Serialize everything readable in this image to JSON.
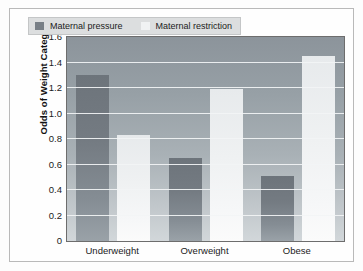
{
  "chart_data": {
    "type": "bar",
    "title": "",
    "subtitle": "",
    "xlabel": "",
    "ylabel": "Odds of Weight Category",
    "categories": [
      "Underweight",
      "Overweight",
      "Obese"
    ],
    "series": [
      {
        "name": "Maternal pressure",
        "values": [
          1.3,
          0.65,
          0.51
        ],
        "color": "#787f86"
      },
      {
        "name": "Maternal restriction",
        "values": [
          0.83,
          1.19,
          1.45
        ],
        "color": "#f0f2f3"
      }
    ],
    "ylim": [
      0,
      1.6
    ],
    "yticks": [
      "0",
      "0.2",
      "0.4",
      "0.6",
      "0.8",
      "1.0",
      "1.2",
      "1.4",
      "1.6"
    ],
    "ytick_values": [
      0,
      0.2,
      0.4,
      0.6,
      0.8,
      1.0,
      1.2,
      1.4,
      1.6
    ],
    "grid": true,
    "grid_color": "#f2f4f5",
    "legend_position": "top-left-inside",
    "plot_background": "#9aa2a8",
    "figure_background": "#fefefe",
    "border_color": "#b9b9b9"
  }
}
